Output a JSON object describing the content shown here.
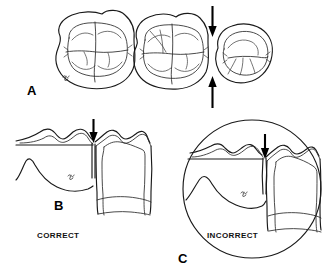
{
  "figure": {
    "background_color": "#ffffff",
    "ink_color": "#1a1a1a",
    "width": 325,
    "height": 277
  },
  "panels": [
    {
      "id": "A",
      "letter": "A",
      "view": "occlusal",
      "description": "Occlusal view of three adjacent posterior teeth with vertical arrows marking the proximal contact area",
      "teeth": [
        {
          "name": "molar-left",
          "type": "molar"
        },
        {
          "name": "molar-middle",
          "type": "molar"
        },
        {
          "name": "premolar-right",
          "type": "premolar"
        }
      ],
      "arrows": [
        {
          "name": "contact-arrow-top",
          "direction": "down"
        },
        {
          "name": "contact-arrow-bottom",
          "direction": "up"
        }
      ]
    },
    {
      "id": "B",
      "letter": "B",
      "view": "proximal",
      "caption": "CORRECT",
      "description": "Proximal view showing a correct, properly located contact between adjacent teeth",
      "arrows": [
        {
          "name": "contact-arrow",
          "direction": "down"
        }
      ]
    },
    {
      "id": "C",
      "letter": "C",
      "view": "proximal-magnified",
      "caption": "INCORRECT",
      "description": "Circular magnified proximal view showing an incorrect, open or mislocated contact",
      "arrows": [
        {
          "name": "contact-arrow",
          "direction": "down"
        }
      ]
    }
  ],
  "labels": {
    "panel_a": "A",
    "panel_b": "B",
    "panel_c": "C",
    "caption_correct": "CORRECT",
    "caption_incorrect": "INCORRECT"
  }
}
